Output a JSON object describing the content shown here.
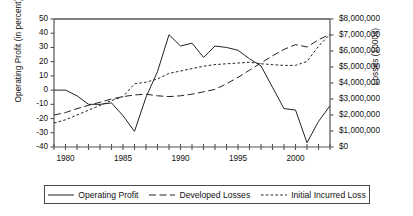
{
  "chart_data": {
    "type": "line",
    "title": "",
    "xlabel": "",
    "ylabel": "Operating Profit (in percent)",
    "ylabel_right": "Losses (1000s)",
    "xlim": [
      1979,
      2003
    ],
    "ylim": [
      -40,
      50
    ],
    "ylim_right": [
      0,
      8000000
    ],
    "grid": false,
    "legend_position": "bottom",
    "x_tick_labels": [
      "1980",
      "1985",
      "1990",
      "1995",
      "2000"
    ],
    "x_tick_values": [
      1980,
      1985,
      1990,
      1995,
      2000
    ],
    "x_minor_ticks_every": 1,
    "y_tick_labels_left": [
      "50",
      "40",
      "30",
      "20",
      "10",
      "0",
      "-10",
      "-20",
      "-30",
      "-40"
    ],
    "y_tick_values_left": [
      50,
      40,
      30,
      20,
      10,
      0,
      -10,
      -20,
      -30,
      -40
    ],
    "y_tick_labels_right": [
      "$8,000,000",
      "$7,000,000",
      "$6,000,000",
      "$5,000,000",
      "$4,000,000",
      "$3,000,000",
      "$2,000,000",
      "$1,000,000",
      "$0"
    ],
    "y_tick_values_right": [
      8000000,
      7000000,
      6000000,
      5000000,
      4000000,
      3000000,
      2000000,
      1000000,
      0
    ],
    "x": [
      1979,
      1980,
      1981,
      1982,
      1983,
      1984,
      1985,
      1986,
      1987,
      1988,
      1989,
      1990,
      1991,
      1992,
      1993,
      1994,
      1995,
      1996,
      1997,
      1998,
      1999,
      2000,
      2001,
      2002,
      2003
    ],
    "series": [
      {
        "name": "Operating Profit",
        "axis": "left",
        "units": "percent",
        "style": "solid",
        "values": [
          0,
          0,
          -4,
          -10,
          -10,
          -9,
          -18,
          -29,
          -5,
          13,
          39,
          31,
          33,
          23,
          31,
          30,
          28,
          22,
          17,
          2,
          -13,
          -14,
          -37,
          -22,
          -11
        ]
      },
      {
        "name": "Developed Losses",
        "axis": "right",
        "units": "dollars",
        "style": "long-dash",
        "values": [
          2000000,
          2150000,
          2400000,
          2600000,
          2800000,
          3000000,
          3150000,
          3250000,
          3300000,
          3200000,
          3150000,
          3200000,
          3300000,
          3450000,
          3600000,
          3950000,
          4350000,
          4800000,
          5250000,
          5700000,
          6100000,
          6400000,
          6250000,
          6700000,
          7050000
        ]
      },
      {
        "name": "Initial Incurred Loss",
        "axis": "right",
        "units": "dollars",
        "style": "short-dash",
        "values": [
          1500000,
          1700000,
          2000000,
          2300000,
          2600000,
          2900000,
          3150000,
          3950000,
          4050000,
          4250000,
          4600000,
          4750000,
          4900000,
          5050000,
          5150000,
          5200000,
          5250000,
          5300000,
          5200000,
          5150000,
          5100000,
          5100000,
          5350000,
          6300000,
          7050000
        ]
      }
    ]
  },
  "legend": {
    "items": [
      {
        "label": "Operating Profit",
        "style": "solid"
      },
      {
        "label": "Developed Losses",
        "style": "long-dash"
      },
      {
        "label": "Initial Incurred Loss",
        "style": "short-dash"
      }
    ]
  },
  "colors": {
    "line": "#222222",
    "axis": "#555555",
    "text": "#111111",
    "background": "#ffffff"
  }
}
